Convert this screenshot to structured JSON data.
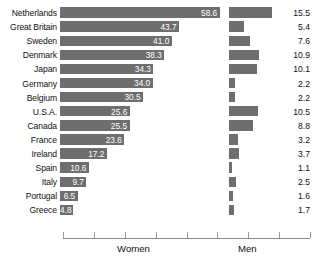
{
  "chart_data": {
    "type": "bar",
    "orientation": "horizontal",
    "layout": "back-to-back paired bars (women bars grow right from left baseline, men bars grow right from center baseline)",
    "title": "",
    "subtitle": "",
    "xlabel": "",
    "ylabel": "",
    "grid": false,
    "legend_position": "below-axis",
    "categories": [
      "Netherlands",
      "Great Britain",
      "Sweden",
      "Denmark",
      "Japan",
      "Germany",
      "Belgium",
      "U.S.A.",
      "Canada",
      "France",
      "Ireland",
      "Spain",
      "Italy",
      "Portugal",
      "Greece"
    ],
    "series": [
      {
        "name": "Women",
        "labels_shown": true,
        "label_color": "#ffffff",
        "values": [
          58.6,
          43.7,
          41.0,
          38.3,
          34.3,
          34.0,
          30.5,
          25.6,
          25.5,
          23.6,
          17.2,
          10.6,
          9.7,
          6.5,
          4.8
        ]
      },
      {
        "name": "Men",
        "labels_shown": true,
        "label_color": "#111111",
        "values": [
          15.5,
          5.4,
          7.6,
          10.9,
          10.1,
          2.2,
          2.2,
          10.5,
          8.8,
          3.2,
          3.7,
          1.1,
          2.5,
          1.6,
          1.7
        ]
      }
    ],
    "women_value_labels": [
      "58.6",
      "43.7",
      "41.0",
      "38.3",
      "34.3",
      "34.0",
      "30.5",
      "25.6",
      "25.5",
      "23.6",
      "17.2",
      "10.6",
      "9.7",
      "6.5",
      "4.8"
    ],
    "men_value_labels": [
      "15.5",
      "5.4",
      "7.6",
      "10.9",
      "10.1",
      "2.2",
      "2.2",
      "10.5",
      "8.8",
      "3.2",
      "3.7",
      "1.1",
      "2.5",
      "1.6",
      "1.7"
    ],
    "xlim_women": [
      0,
      62
    ],
    "xlim_men": [
      0,
      18
    ],
    "bar_color": "#6e6e6e",
    "axis_color": "#8a8a8a"
  },
  "axis": {
    "women_caption": "Women",
    "men_caption": "Men",
    "tick_count": 9
  },
  "footer": {
    "note": ""
  }
}
